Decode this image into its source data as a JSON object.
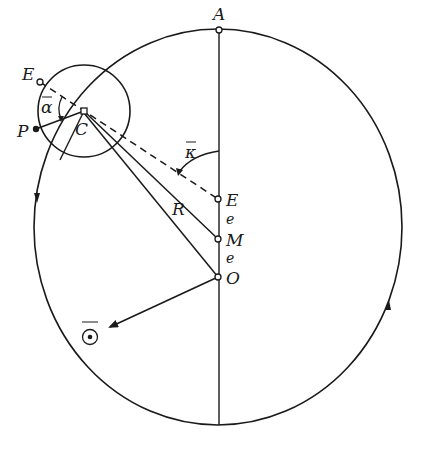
{
  "diagram": {
    "type": "epicycle-equant model",
    "colors": {
      "stroke": "#1a1a1a",
      "background": "#ffffff"
    },
    "labels": {
      "A": "A",
      "E_epicycle": "E",
      "P": "P",
      "C": "C",
      "alpha": "α",
      "kappa": "κ",
      "R": "R",
      "E_equant": "E",
      "e1": "e",
      "M": "M",
      "e2": "e",
      "O": "O",
      "sun": "☉"
    },
    "points": {
      "A": [
        219,
        30
      ],
      "C": [
        84,
        111
      ],
      "E_epicycle": [
        40,
        82
      ],
      "P": [
        36,
        129
      ],
      "E_equant": [
        218,
        199
      ],
      "M": [
        218,
        239
      ],
      "O": [
        218,
        277
      ],
      "sun": [
        90,
        337
      ]
    }
  }
}
